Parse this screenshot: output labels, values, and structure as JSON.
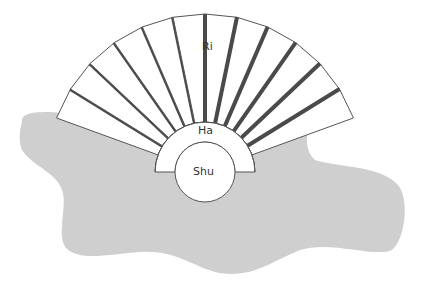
{
  "diagram": {
    "labels": {
      "inner": "Shu",
      "middle": "Ha",
      "outer": "Ri"
    },
    "colors": {
      "blob": "#cfcfcf",
      "blade_fill": "#ffffff",
      "blade_shadow": "#4a4a4a",
      "outline": "#555555"
    },
    "blade_count": 12
  }
}
